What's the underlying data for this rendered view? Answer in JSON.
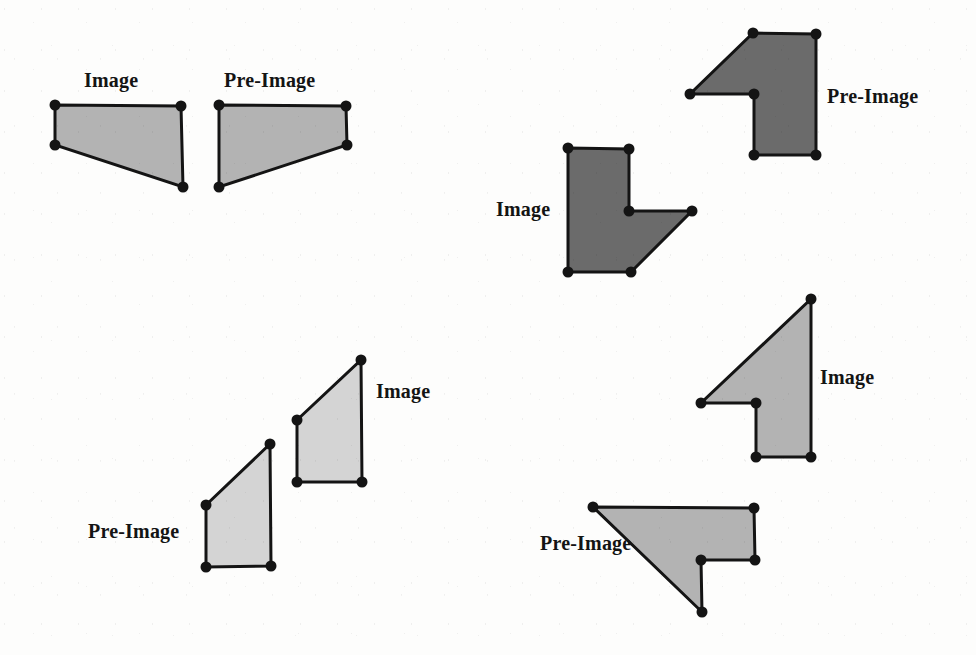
{
  "figure": {
    "type": "geometry-transformation-worksheet",
    "background_color": "#fdfdfc",
    "outline_color": "#141414",
    "vertex_color": "#141414",
    "fill_light": "#b3b3b3",
    "fill_dark": "#6b6b6b",
    "stroke_width": 3,
    "vertex_radius": 5.5,
    "labels": [
      {
        "id": "label-pair1-image",
        "text": "Image",
        "x": 84,
        "y": 70
      },
      {
        "id": "label-pair1-preimage",
        "text": "Pre-Image",
        "x": 224,
        "y": 70
      },
      {
        "id": "label-pair2-preimage",
        "text": "Pre-Image",
        "x": 827,
        "y": 86
      },
      {
        "id": "label-pair2-image",
        "text": "Image",
        "x": 496,
        "y": 199
      },
      {
        "id": "label-pair3-image",
        "text": "Image",
        "x": 376,
        "y": 381
      },
      {
        "id": "label-pair3-preimage",
        "text": "Pre-Image",
        "x": 88,
        "y": 521
      },
      {
        "id": "label-pair4-image",
        "text": "Image",
        "x": 820,
        "y": 367
      },
      {
        "id": "label-pair4-preimage",
        "text": "Pre-Image",
        "x": 540,
        "y": 533
      }
    ],
    "shapes": [
      {
        "id": "pair1-image",
        "role": "Image",
        "fill": "#b3b3b3",
        "points": [
          [
            55,
            105
          ],
          [
            181,
            106
          ],
          [
            183,
            187
          ],
          [
            55,
            145
          ]
        ]
      },
      {
        "id": "pair1-preimage",
        "role": "Pre-Image",
        "fill": "#b3b3b3",
        "points": [
          [
            219,
            105
          ],
          [
            346,
            106
          ],
          [
            347,
            145
          ],
          [
            219,
            187
          ]
        ]
      },
      {
        "id": "pair2-image",
        "role": "Image",
        "fill": "#6b6b6b",
        "points": [
          [
            568,
            148
          ],
          [
            629,
            149
          ],
          [
            629,
            211
          ],
          [
            692,
            211
          ],
          [
            631,
            272
          ],
          [
            568,
            272
          ]
        ]
      },
      {
        "id": "pair2-preimage",
        "role": "Pre-Image",
        "fill": "#6b6b6b",
        "points": [
          [
            753,
            33
          ],
          [
            816,
            34
          ],
          [
            816,
            155
          ],
          [
            754,
            155
          ],
          [
            754,
            94
          ],
          [
            690,
            94
          ]
        ]
      },
      {
        "id": "pair3-image",
        "role": "Image",
        "fill": "#d4d4d4",
        "points": [
          [
            297,
            420
          ],
          [
            361,
            360
          ],
          [
            362,
            482
          ],
          [
            297,
            482
          ]
        ]
      },
      {
        "id": "pair3-preimage",
        "role": "Pre-Image",
        "fill": "#d4d4d4",
        "points": [
          [
            206,
            505
          ],
          [
            270,
            444
          ],
          [
            271,
            566
          ],
          [
            206,
            567
          ]
        ]
      },
      {
        "id": "pair4-image",
        "role": "Image",
        "fill": "#b3b3b3",
        "points": [
          [
            811,
            299
          ],
          [
            811,
            457
          ],
          [
            756,
            457
          ],
          [
            756,
            403
          ],
          [
            701,
            403
          ]
        ]
      },
      {
        "id": "pair4-preimage",
        "role": "Pre-Image",
        "fill": "#b3b3b3",
        "points": [
          [
            593,
            507
          ],
          [
            754,
            508
          ],
          [
            755,
            560
          ],
          [
            701,
            560
          ],
          [
            702,
            612
          ]
        ]
      }
    ]
  }
}
